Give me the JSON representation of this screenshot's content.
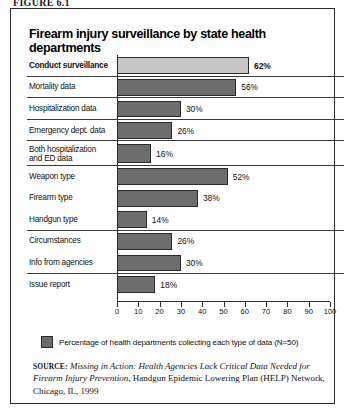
{
  "figure": {
    "label": "FIGURE 6.1"
  },
  "chart_title": "Firearm injury surveillance by state health departments",
  "legend": {
    "swatch_color": "#6d6d6d",
    "text": "Percentage of health departments collecting each type of data (N=50)"
  },
  "source": {
    "label": "SOURCE:",
    "italic_part": "Missing in Action: Health Agencies Lack Critical Data Needed for Firearm Injury Prevention,",
    "roman_part": " Handgun Epidemic Lowering Plan (HELP) Network, Chicago, IL, 1999"
  },
  "colors": {
    "bar_highlight": "#c6c6c6",
    "bar_default": "#6d6d6d",
    "outline": "#2b2b2b",
    "border": "#2a2a2a"
  },
  "chart_data": {
    "type": "bar",
    "orientation": "horizontal",
    "title": "Firearm injury surveillance by state health departments",
    "xlabel": "",
    "ylabel": "",
    "xlim": [
      0,
      100
    ],
    "xticks": [
      "0",
      "10",
      "20",
      "30",
      "40",
      "50",
      "60",
      "70",
      "80",
      "90",
      "100"
    ],
    "grid": false,
    "legend_position": "bottom-left",
    "units": "percent",
    "sample_size": 50,
    "categories": [
      "Conduct surveillance",
      "Mortality data",
      "Hospitalization data",
      "Emergency dept. data",
      "Both hospitalization and ED data",
      "Weapon type",
      "Firearm type",
      "Handgun type",
      "Circumstances",
      "Info from agencies",
      "Issue report"
    ],
    "values": [
      62,
      56,
      30,
      26,
      16,
      52,
      38,
      14,
      26,
      30,
      18
    ],
    "value_labels": [
      "62%",
      "56%",
      "30%",
      "26%",
      "16%",
      "52%",
      "38%",
      "14%",
      "26%",
      "30%",
      "18%"
    ],
    "bars": [
      {
        "label": "Conduct surveillance",
        "label_lines": [
          "Conduct surveillance"
        ],
        "value": 62,
        "value_label": "62%",
        "style": "light",
        "emphasis": true,
        "separator": true,
        "tall": false
      },
      {
        "label": "Mortality data",
        "label_lines": [
          "Mortality data"
        ],
        "value": 56,
        "value_label": "56%",
        "style": "dark",
        "emphasis": false,
        "separator": true,
        "tall": false
      },
      {
        "label": "Hospitalization data",
        "label_lines": [
          "Hospitalization data"
        ],
        "value": 30,
        "value_label": "30%",
        "style": "dark",
        "emphasis": false,
        "separator": true,
        "tall": false
      },
      {
        "label": "Emergency dept. data",
        "label_lines": [
          "Emergency dept. data"
        ],
        "value": 26,
        "value_label": "26%",
        "style": "dark",
        "emphasis": false,
        "separator": true,
        "tall": false
      },
      {
        "label": "Both hospitalization and ED data",
        "label_lines": [
          "Both hospitalization",
          "and ED data"
        ],
        "value": 16,
        "value_label": "16%",
        "style": "dark",
        "emphasis": false,
        "separator": true,
        "tall": true
      },
      {
        "label": "Weapon type",
        "label_lines": [
          "Weapon type"
        ],
        "value": 52,
        "value_label": "52%",
        "style": "dark",
        "emphasis": false,
        "separator": false,
        "tall": false
      },
      {
        "label": "Firearm type",
        "label_lines": [
          "Firearm type"
        ],
        "value": 38,
        "value_label": "38%",
        "style": "dark",
        "emphasis": false,
        "separator": false,
        "tall": false
      },
      {
        "label": "Handgun type",
        "label_lines": [
          "Handgun type"
        ],
        "value": 14,
        "value_label": "14%",
        "style": "dark",
        "emphasis": false,
        "separator": true,
        "tall": false
      },
      {
        "label": "Circumstances",
        "label_lines": [
          "Circumstances"
        ],
        "value": 26,
        "value_label": "26%",
        "style": "dark",
        "emphasis": false,
        "separator": false,
        "tall": false
      },
      {
        "label": "Info from agencies",
        "label_lines": [
          "Info from agencies"
        ],
        "value": 30,
        "value_label": "30%",
        "style": "dark",
        "emphasis": false,
        "separator": true,
        "tall": false
      },
      {
        "label": "Issue report",
        "label_lines": [
          "Issue report"
        ],
        "value": 18,
        "value_label": "18%",
        "style": "dark",
        "emphasis": false,
        "separator": false,
        "tall": false
      }
    ]
  }
}
